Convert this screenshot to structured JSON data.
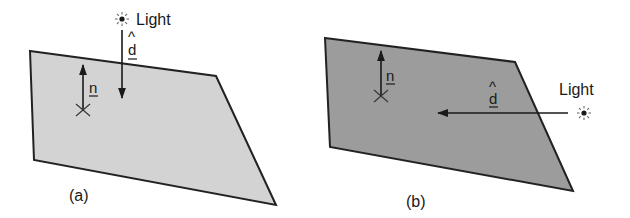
{
  "figure": {
    "panels": [
      {
        "id": "a",
        "caption": "(a)",
        "surface_shade": "#d3d3d3",
        "light_label": "Light",
        "light_direction_symbol": "d",
        "light_direction_hat": "^",
        "normal_symbol": "n",
        "light_position": "above",
        "icons": [
          "sun-icon"
        ]
      },
      {
        "id": "b",
        "caption": "(b)",
        "surface_shade": "#9c9c9c",
        "light_label": "Light",
        "light_direction_symbol": "d",
        "light_direction_hat": "^",
        "normal_symbol": "n",
        "light_position": "side",
        "icons": [
          "sun-icon"
        ]
      }
    ],
    "stroke_color": "#222222"
  }
}
